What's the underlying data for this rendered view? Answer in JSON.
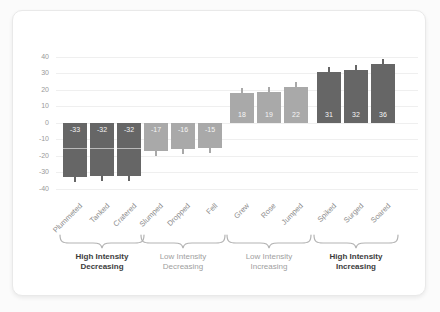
{
  "chart_data": {
    "type": "bar",
    "categories": [
      "Plummeted",
      "Tanked",
      "Cratered",
      "Slumped",
      "Dropped",
      "Fell",
      "Grew",
      "Rose",
      "Jumped",
      "Spiked",
      "Surged",
      "Soared"
    ],
    "values": [
      -33,
      -32,
      -32,
      -17,
      -16,
      -15,
      18,
      19,
      22,
      31,
      32,
      36
    ],
    "value_labels": [
      "-33",
      "-32",
      "-32",
      "-17",
      "-16",
      "-15",
      "18",
      "19",
      "22",
      "31",
      "32",
      "36"
    ],
    "error_bars": [
      3,
      3,
      3,
      3,
      3,
      3,
      3,
      3,
      3,
      3,
      3,
      3
    ],
    "groups": [
      {
        "line1": "High Intensity",
        "line2": "Decreasing",
        "emphasis": true,
        "bar_color": "#666666"
      },
      {
        "line1": "Low Intensity",
        "line2": "Decreasing",
        "emphasis": false,
        "bar_color": "#a9a9a9"
      },
      {
        "line1": "Low Intensity",
        "line2": "Increasing",
        "emphasis": false,
        "bar_color": "#a9a9a9"
      },
      {
        "line1": "High Intensity",
        "line2": "Increasing",
        "emphasis": true,
        "bar_color": "#666666"
      }
    ],
    "yticks": [
      40,
      30,
      20,
      10,
      0,
      -10,
      -20,
      -30,
      -40
    ],
    "ylim": [
      -40,
      40
    ],
    "grid": true,
    "legend": null,
    "title": "",
    "xlabel": "",
    "ylabel": "",
    "highlight_stripe": {
      "value": -15,
      "group_index": 0
    },
    "colors": {
      "grid": "#efefef",
      "tick_label": "#999999",
      "category_label": "#8c8c8c",
      "brace": "#b3b3b3",
      "group_label_emphasis": "#3c3c3c",
      "group_label_muted": "#a0a0a0",
      "bar_value_text": "#f5f5f5",
      "dark_bar": "#666666",
      "light_bar": "#a9a9a9"
    }
  }
}
